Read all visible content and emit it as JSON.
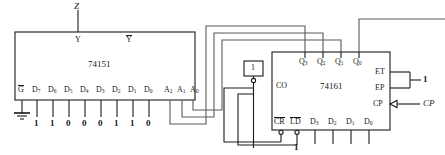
{
  "figure": {
    "kind": "logic-circuit-schematic",
    "top_signal": "Z",
    "clock_signal": "CP"
  },
  "mux": {
    "name": "74151",
    "outputs": [
      {
        "id": "Y",
        "label": "Y",
        "overbar": false
      },
      {
        "id": "Yn",
        "label": "Y",
        "overbar": true
      }
    ],
    "enable": {
      "label": "G",
      "overbar": true,
      "tied_to": "ground"
    },
    "data_pins": [
      {
        "label": "D",
        "sub": "7",
        "value": "1"
      },
      {
        "label": "D",
        "sub": "6",
        "value": "1"
      },
      {
        "label": "D",
        "sub": "5",
        "value": "0"
      },
      {
        "label": "D",
        "sub": "4",
        "value": "0"
      },
      {
        "label": "D",
        "sub": "3",
        "value": "0"
      },
      {
        "label": "D",
        "sub": "2",
        "value": "1"
      },
      {
        "label": "D",
        "sub": "1",
        "value": "1"
      },
      {
        "label": "D",
        "sub": "0",
        "value": "0"
      }
    ],
    "address_pins": [
      {
        "label": "A",
        "sub": "2"
      },
      {
        "label": "A",
        "sub": "1"
      },
      {
        "label": "A",
        "sub": "0"
      }
    ]
  },
  "counter": {
    "name": "74161",
    "outputs": [
      {
        "label": "Q",
        "sub": "3"
      },
      {
        "label": "Q",
        "sub": "2"
      },
      {
        "label": "Q",
        "sub": "1"
      },
      {
        "label": "Q",
        "sub": "0"
      }
    ],
    "carry_out": "CO",
    "enables": [
      {
        "label": "ET"
      },
      {
        "label": "EP"
      }
    ],
    "enable_value": "1",
    "clock_pin": "CP",
    "control_pins": [
      {
        "label": "CR",
        "overbar": true,
        "bubble": true
      },
      {
        "label": "LD",
        "overbar": true,
        "bubble": true
      }
    ],
    "load_value": "1",
    "data_pins": [
      {
        "label": "D",
        "sub": "3"
      },
      {
        "label": "D",
        "sub": "2"
      },
      {
        "label": "D",
        "sub": "1"
      },
      {
        "label": "D",
        "sub": "0"
      }
    ]
  },
  "inverter": {
    "symbol": "1",
    "bubble": true
  },
  "colors": {
    "ink": "#1a1a1a",
    "wire": "#4a4a4a",
    "paper": "#ffffff"
  }
}
